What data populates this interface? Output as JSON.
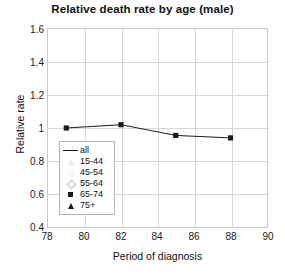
{
  "chart_data": {
    "type": "line",
    "title": "Relative death rate by age (male)",
    "xlabel": "Period of diagnosis",
    "ylabel": "Relative rate",
    "xlim": [
      78,
      90
    ],
    "ylim": [
      0.4,
      1.6
    ],
    "xticks": [
      78,
      80,
      82,
      84,
      86,
      88,
      90
    ],
    "yticks": [
      0.4,
      0.6,
      0.8,
      1,
      1.2,
      1.4,
      1.6
    ],
    "xtick_labels": [
      "78",
      "80",
      "82",
      "84",
      "86",
      "88",
      "90"
    ],
    "ytick_labels": [
      "0.4",
      "0.6",
      "0.8",
      "1",
      "1.2",
      "1.4",
      "1.6"
    ],
    "grid": true,
    "legend_position": "inside-lower-left",
    "series": [
      {
        "name": "all",
        "marker": "line",
        "color": "#1a1a1a",
        "x": [],
        "values": []
      },
      {
        "name": "15-44",
        "marker": "triangle-open",
        "color": "#ececec",
        "x": [],
        "values": []
      },
      {
        "name": "45-54",
        "marker": "circle-open",
        "color": "#efefef",
        "x": [],
        "values": []
      },
      {
        "name": "55-64",
        "marker": "diamond-open",
        "color": "#c4c4c4",
        "x": [],
        "values": []
      },
      {
        "name": "65-74",
        "marker": "square-filled",
        "color": "#1a1a1a",
        "x": [
          79,
          82,
          85,
          88
        ],
        "values": [
          1.0,
          1.02,
          0.955,
          0.94
        ]
      },
      {
        "name": "75+",
        "marker": "triangle-filled",
        "color": "#1a1a1a",
        "x": [],
        "values": []
      }
    ]
  },
  "legend": {
    "entries": [
      {
        "label": "all"
      },
      {
        "label": "15-44"
      },
      {
        "label": "45-54"
      },
      {
        "label": "55-64"
      },
      {
        "label": "65-74"
      },
      {
        "label": "75+"
      }
    ]
  }
}
